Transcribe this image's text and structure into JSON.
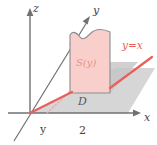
{
  "figure": {
    "background": "#ffffff",
    "axes": {
      "x_label": "x",
      "y_label": "y",
      "z_label": "z",
      "axis_color": "#6e7175"
    },
    "ticks": [
      {
        "name": "y",
        "label": "y"
      },
      {
        "name": "two",
        "label": "2"
      }
    ],
    "labels": {
      "cross_section": "S(y)",
      "region": "D",
      "line": "y=x"
    },
    "colors": {
      "slab_fill": "#f8cfcb",
      "slab_stroke": "#8a8d91",
      "region_fill": "#cfcfcf",
      "line_red": "#e8605c",
      "cross_text": "#ea8f8b",
      "axis": "#6e7175",
      "region_text": "#55585c"
    }
  }
}
